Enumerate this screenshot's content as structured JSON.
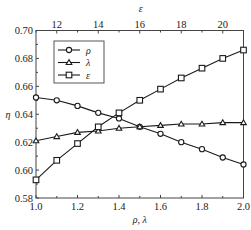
{
  "chart_data": {
    "type": "line",
    "title": "",
    "xlabel": "ρ, λ",
    "x2label": "ε",
    "ylabel": "η",
    "xlim": [
      1.0,
      2.0
    ],
    "x2lim": [
      11,
      21
    ],
    "ylim": [
      0.58,
      0.7
    ],
    "grid": false,
    "legend_position": "upper left",
    "x_ticks": [
      "1.0",
      "1.2",
      "1.4",
      "1.6",
      "1.8",
      "2.0"
    ],
    "x2_ticks": [
      "12",
      "14",
      "16",
      "18",
      "20"
    ],
    "y_ticks": [
      "0.58",
      "0.60",
      "0.62",
      "0.64",
      "0.66",
      "0.68",
      "0.70"
    ],
    "x": [
      1.0,
      1.1,
      1.2,
      1.3,
      1.4,
      1.5,
      1.6,
      1.7,
      1.8,
      1.9,
      2.0
    ],
    "x2": [
      11,
      12,
      13,
      14,
      15,
      16,
      17,
      18,
      19,
      20,
      21
    ],
    "series": [
      {
        "name": "ρ",
        "marker": "circle",
        "axis": "bottom",
        "values": [
          0.652,
          0.65,
          0.646,
          0.641,
          0.637,
          0.631,
          0.626,
          0.62,
          0.615,
          0.609,
          0.604
        ]
      },
      {
        "name": "λ",
        "marker": "triangle",
        "axis": "bottom",
        "values": [
          0.621,
          0.624,
          0.627,
          0.628,
          0.63,
          0.631,
          0.632,
          0.633,
          0.633,
          0.634,
          0.634
        ]
      },
      {
        "name": "ε",
        "marker": "square",
        "axis": "top",
        "values": [
          0.593,
          0.607,
          0.619,
          0.631,
          0.641,
          0.65,
          0.658,
          0.666,
          0.673,
          0.68,
          0.686
        ]
      }
    ]
  },
  "colors": {
    "line": "#1a1a1a",
    "axis": "#444444",
    "background": "#ffffff"
  }
}
